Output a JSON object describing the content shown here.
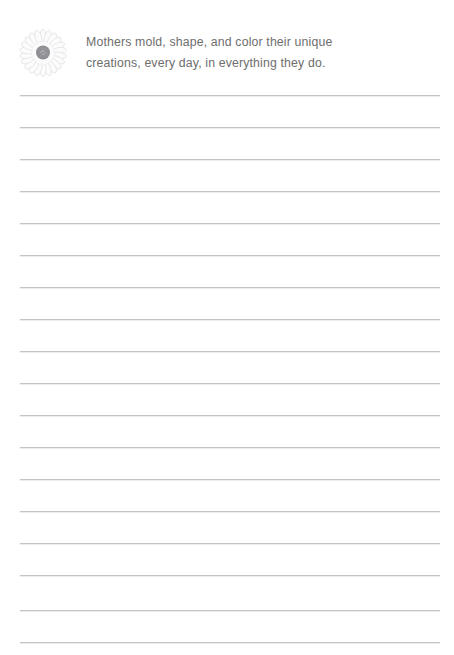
{
  "page": {
    "type": "lined-stationery-page",
    "background_color": "#ffffff",
    "width": 454,
    "height": 655
  },
  "header": {
    "icon": {
      "name": "daisy-flower-icon",
      "description": "white daisy flower with gray textured center",
      "petal_color": "#ffffff",
      "petal_outline_color": "#d9d9dd",
      "center_color": "#8f8f93"
    },
    "quote": {
      "line1": "Mothers mold, shape, and color their unique",
      "line2": "creations, every day, in everything they do.",
      "text_color": "#6e6e6e"
    }
  },
  "writing_area": {
    "line_color": "#c4c4c6",
    "line_shadow_color": "#ececee",
    "line_left": 20,
    "line_right": 440,
    "line_spacing": 32,
    "first_line_y": 95,
    "line_count": 18,
    "line_positions": [
      95,
      127,
      159,
      191,
      223,
      255,
      287,
      319,
      351,
      383,
      415,
      447,
      479,
      511,
      543,
      575,
      610,
      642
    ]
  }
}
